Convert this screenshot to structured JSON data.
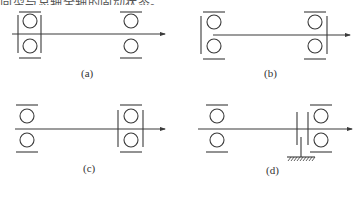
{
  "header": {
    "cut_off_text": "向型与总轴全轴的固动状态。"
  },
  "panels": [
    {
      "id": "a",
      "label": "(a)",
      "description": "Left bearing pair fixed with both-side retainers; right bearing pair free; shaft arrow to right"
    },
    {
      "id": "b",
      "label": "(b)",
      "description": "Left bearing pair retained on left side; right bearing pair retained on right side; shaft arrow to right"
    },
    {
      "id": "c",
      "label": "(c)",
      "description": "Left bearing pair free; right bearing pair fixed with both-side retainers; shaft arrow to right"
    },
    {
      "id": "d",
      "label": "(d)",
      "description": "Left bearing pair free; right bearing pair with retainer and grounded support (hatched); shaft arrow to right"
    }
  ],
  "colors": {
    "stroke": "#3a3a3a",
    "background": "#ffffff"
  }
}
